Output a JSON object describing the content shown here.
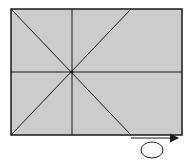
{
  "diagram": {
    "colors": {
      "fill": "#cccccc",
      "stroke": "#1a1a1a",
      "background": "#ffffff"
    },
    "rectangle": {
      "x": 11,
      "y": 9,
      "width": 171,
      "height": 126
    },
    "center_point": {
      "x": 72,
      "y": 72
    },
    "lines": [
      {
        "name": "vertical",
        "x1": 72,
        "y1": 9,
        "x2": 72,
        "y2": 135
      },
      {
        "name": "horizontal",
        "x1": 11,
        "y1": 72,
        "x2": 182,
        "y2": 72
      },
      {
        "name": "diagonal-down",
        "x1": 11,
        "y1": 9,
        "x2": 131,
        "y2": 135
      },
      {
        "name": "diagonal-up",
        "x1": 11,
        "y1": 135,
        "x2": 131,
        "y2": 9
      }
    ],
    "arrow": {
      "x1": 131,
      "y1": 138,
      "x2": 178,
      "y2": 138,
      "direction": "right"
    },
    "ellipse": {
      "cx": 152,
      "cy": 150,
      "rx": 11,
      "ry": 8
    }
  }
}
